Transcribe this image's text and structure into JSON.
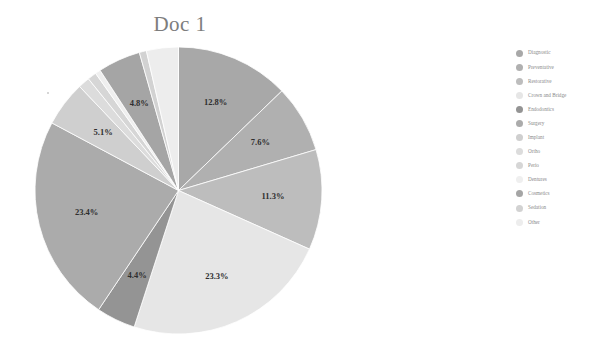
{
  "chart_title": "Doc 1",
  "legend": {
    "items": [
      {
        "label": "Diagnostic",
        "color": "#a8a8a8"
      },
      {
        "label": "Preventative",
        "color": "#b0b0b0"
      },
      {
        "label": "Restorative",
        "color": "#bdbdbd"
      },
      {
        "label": "Crown and Bridge",
        "color": "#e6e6e6"
      },
      {
        "label": "Endodontics",
        "color": "#949494"
      },
      {
        "label": "Surgery",
        "color": "#ababab"
      },
      {
        "label": "Implant",
        "color": "#cfcfcf"
      },
      {
        "label": "Ortho",
        "color": "#dcdcdc"
      },
      {
        "label": "Perio",
        "color": "#d6d6d6"
      },
      {
        "label": "Dentures",
        "color": "#efefef"
      },
      {
        "label": "Cosmetics",
        "color": "#a5a5a5"
      },
      {
        "label": "Sedation",
        "color": "#d2d2d2"
      },
      {
        "label": "Other",
        "color": "#ededed"
      }
    ]
  },
  "chart_data": {
    "type": "pie",
    "title": "Doc 1",
    "xlabel": "",
    "ylabel": "",
    "legend_position": "right",
    "grid": false,
    "start_angle_deg": 0,
    "direction": "clockwise",
    "categories": [
      "Diagnostic",
      "Preventative",
      "Restorative",
      "Crown and Bridge",
      "Endodontics",
      "Surgery",
      "Implant",
      "Ortho",
      "Perio",
      "Dentures",
      "Cosmetics",
      "Sedation",
      "Other"
    ],
    "values": [
      12.8,
      7.6,
      11.3,
      23.3,
      4.4,
      23.4,
      5.1,
      1.3,
      1.0,
      0.6,
      4.8,
      0.8,
      3.6
    ],
    "labels_shown": [
      "12.8%",
      "7.6%",
      "11.3%",
      "23.3%",
      "4.4%",
      "23.4%",
      "5.1%",
      "",
      "",
      "",
      "4.8%",
      "",
      ""
    ],
    "colors": [
      "#a8a8a8",
      "#b0b0b0",
      "#bdbdbd",
      "#e6e6e6",
      "#949494",
      "#ababab",
      "#cfcfcf",
      "#dcdcdc",
      "#d6d6d6",
      "#efefef",
      "#a5a5a5",
      "#d2d2d2",
      "#ededed"
    ],
    "label_color": "#2e2e2e",
    "units": "percent",
    "total_labeled_percent": 92.7
  }
}
